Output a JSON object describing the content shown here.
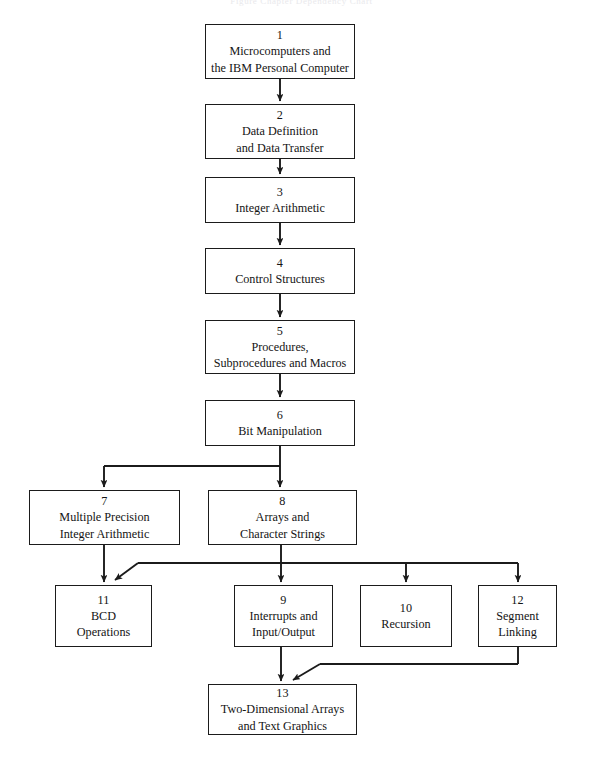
{
  "document": {
    "faint_header": "Figure  Chapter Dependency Chart"
  },
  "diagram": {
    "type": "flowchart",
    "orientation": "top-down",
    "line_color": "#1b1b1b",
    "box_fill": "#ffffff",
    "nodes": [
      {
        "id": "n1",
        "number": "1",
        "title": "Microcomputers and\nthe IBM Personal Computer",
        "x": 205,
        "y": 24,
        "w": 150,
        "h": 55
      },
      {
        "id": "n2",
        "number": "2",
        "title": "Data Definition\nand Data Transfer",
        "x": 205,
        "y": 104,
        "w": 150,
        "h": 55
      },
      {
        "id": "n3",
        "number": "3",
        "title": "Integer Arithmetic",
        "x": 205,
        "y": 177,
        "w": 150,
        "h": 46
      },
      {
        "id": "n4",
        "number": "4",
        "title": "Control Structures",
        "x": 205,
        "y": 248,
        "w": 150,
        "h": 46
      },
      {
        "id": "n5",
        "number": "5",
        "title": "Procedures,\nSubprocedures and Macros",
        "x": 205,
        "y": 320,
        "w": 150,
        "h": 54
      },
      {
        "id": "n6",
        "number": "6",
        "title": "Bit Manipulation",
        "x": 205,
        "y": 400,
        "w": 150,
        "h": 46
      },
      {
        "id": "n7",
        "number": "7",
        "title": "Multiple Precision\nInteger Arithmetic",
        "x": 29,
        "y": 490,
        "w": 151,
        "h": 55
      },
      {
        "id": "n8",
        "number": "8",
        "title": "Arrays and\nCharacter Strings",
        "x": 208,
        "y": 490,
        "w": 149,
        "h": 55
      },
      {
        "id": "n11",
        "number": "11",
        "title": "BCD\nOperations",
        "x": 55,
        "y": 585,
        "w": 97,
        "h": 62
      },
      {
        "id": "n9",
        "number": "9",
        "title": "Interrupts and\nInput/Output",
        "x": 234,
        "y": 585,
        "w": 99,
        "h": 62
      },
      {
        "id": "n10",
        "number": "10",
        "title": "Recursion",
        "x": 360,
        "y": 585,
        "w": 92,
        "h": 62
      },
      {
        "id": "n12",
        "number": "12",
        "title": "Segment\nLinking",
        "x": 478,
        "y": 585,
        "w": 79,
        "h": 62
      },
      {
        "id": "n13",
        "number": "13",
        "title": "Two-Dimensional Arrays\nand Text Graphics",
        "x": 208,
        "y": 684,
        "w": 149,
        "h": 51
      }
    ],
    "edges": [
      {
        "from": "n1",
        "to": "n2",
        "kind": "straight-down"
      },
      {
        "from": "n2",
        "to": "n3",
        "kind": "straight-down"
      },
      {
        "from": "n3",
        "to": "n4",
        "kind": "straight-down"
      },
      {
        "from": "n4",
        "to": "n5",
        "kind": "straight-down"
      },
      {
        "from": "n5",
        "to": "n6",
        "kind": "straight-down"
      },
      {
        "from": "n6",
        "to": "n7",
        "kind": "branch-left"
      },
      {
        "from": "n6",
        "to": "n8",
        "kind": "branch-down"
      },
      {
        "from": "n7",
        "to": "n11",
        "kind": "straight-down"
      },
      {
        "from": "n8",
        "to": "n9",
        "kind": "straight-down"
      },
      {
        "from": "n8",
        "to": "n11",
        "kind": "bus-diagonal-left"
      },
      {
        "from": "n8",
        "to": "n10",
        "kind": "bus-down"
      },
      {
        "from": "n8",
        "to": "n12",
        "kind": "bus-down"
      },
      {
        "from": "n9",
        "to": "n13",
        "kind": "straight-down"
      },
      {
        "from": "n12",
        "to": "n13",
        "kind": "bus-diagonal-left"
      }
    ]
  }
}
